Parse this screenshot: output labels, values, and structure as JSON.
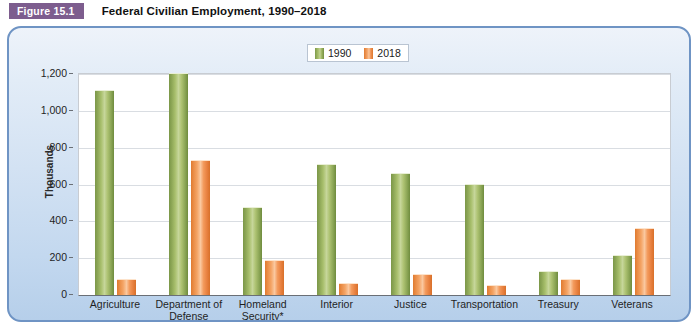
{
  "figure": {
    "badge": "Figure 15.1",
    "title": "Federal Civilian Employment, 1990–2018"
  },
  "chart_data": {
    "type": "bar",
    "title": "Federal Civilian Employment, 1990–2018",
    "xlabel": "",
    "ylabel": "Thousands",
    "ylim": [
      0,
      1200
    ],
    "ytick_labels": [
      "0",
      "200",
      "400",
      "600",
      "800",
      "1,000",
      "1,200"
    ],
    "yticks": [
      0,
      200,
      400,
      600,
      800,
      1000,
      1200
    ],
    "grid": true,
    "legend_position": "top-center",
    "categories": [
      "Agriculture",
      "Department of Defense",
      "Homeland Security*",
      "Interior",
      "Justice",
      "Transportation",
      "Treasury",
      "Veterans"
    ],
    "series": [
      {
        "name": "1990",
        "color": "#9cb35f",
        "values": [
          1110,
          1200,
          475,
          705,
          655,
          595,
          125,
          210
        ]
      },
      {
        "name": "2018",
        "color": "#f0924f",
        "values": [
          80,
          730,
          185,
          60,
          110,
          50,
          80,
          360
        ]
      }
    ]
  }
}
